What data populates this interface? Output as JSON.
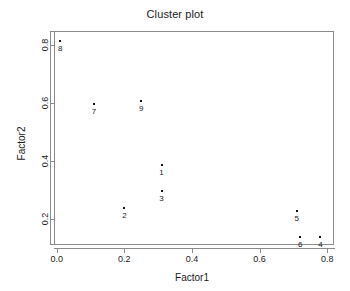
{
  "chart_data": {
    "type": "scatter",
    "title": "Cluster plot",
    "xlabel": "Factor1",
    "ylabel": "Factor2",
    "xlim": [
      -0.02,
      0.82
    ],
    "ylim": [
      0.11,
      0.85
    ],
    "grid": false,
    "legend": false,
    "xticks": [
      "0.0",
      "0.2",
      "0.4",
      "0.6",
      "0.8"
    ],
    "xtick_values": [
      0.0,
      0.2,
      0.4,
      0.6,
      0.8
    ],
    "yticks": [
      "0.2",
      "0.4",
      "0.6",
      "0.8"
    ],
    "ytick_values": [
      0.2,
      0.4,
      0.6,
      0.8
    ],
    "point_labels": [
      "1",
      "2",
      "3",
      "4",
      "5",
      "6",
      "7",
      "8",
      "9"
    ],
    "points": [
      {
        "label": "1",
        "x": 0.31,
        "y": 0.39
      },
      {
        "label": "2",
        "x": 0.2,
        "y": 0.24
      },
      {
        "label": "3",
        "x": 0.31,
        "y": 0.3
      },
      {
        "label": "4",
        "x": 0.78,
        "y": 0.14
      },
      {
        "label": "5",
        "x": 0.71,
        "y": 0.23
      },
      {
        "label": "6",
        "x": 0.72,
        "y": 0.14
      },
      {
        "label": "7",
        "x": 0.11,
        "y": 0.6
      },
      {
        "label": "8",
        "x": 0.01,
        "y": 0.82
      },
      {
        "label": "9",
        "x": 0.25,
        "y": 0.61
      }
    ],
    "colors": {
      "point": "#111111",
      "axis": "#8c8c8c",
      "text": "#1a1a1a",
      "background": "#ffffff"
    }
  }
}
